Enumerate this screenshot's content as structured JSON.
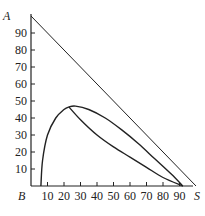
{
  "chart_data": {
    "type": "line",
    "title": "",
    "xlabel": "",
    "ylabel": "",
    "xlim": [
      0,
      100
    ],
    "ylim": [
      0,
      100
    ],
    "grid": false,
    "corner_labels": {
      "top_left": "A",
      "bottom_left": "B",
      "bottom_right": "S"
    },
    "x_ticks": [
      10,
      20,
      30,
      40,
      50,
      60,
      70,
      80,
      90
    ],
    "y_ticks": [
      10,
      20,
      30,
      40,
      50,
      60,
      70,
      80,
      90
    ],
    "series": [
      {
        "name": "A-S line",
        "x": [
          0,
          100
        ],
        "y": [
          100,
          0
        ]
      },
      {
        "name": "binodal curve upper",
        "x": [
          6,
          7,
          10,
          15,
          20,
          23,
          27,
          35,
          45,
          55,
          65,
          75,
          85,
          92
        ],
        "y": [
          0,
          15,
          30,
          40,
          45,
          46.5,
          47,
          45,
          40,
          33,
          25,
          16,
          7,
          0
        ]
      },
      {
        "name": "conjugate line",
        "x": [
          23,
          30,
          40,
          50,
          60,
          70,
          80,
          92
        ],
        "y": [
          46.5,
          39,
          30,
          23,
          17,
          11,
          5,
          0
        ]
      }
    ]
  },
  "labels": {
    "A": "A",
    "B": "B",
    "S": "S"
  }
}
